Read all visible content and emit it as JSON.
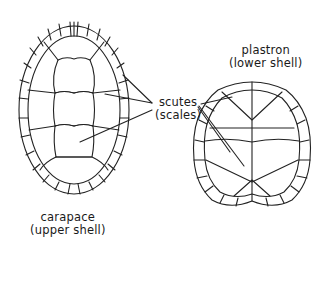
{
  "labels": {
    "scutes": "scutes",
    "scales": "(scales)",
    "plastron": "plastron",
    "plastron_desc": "(lower shell)",
    "carapace": "carapace",
    "carapace_desc": "(upper shell)"
  },
  "colors": {
    "background": "#ffffff",
    "ink": "#222222"
  }
}
